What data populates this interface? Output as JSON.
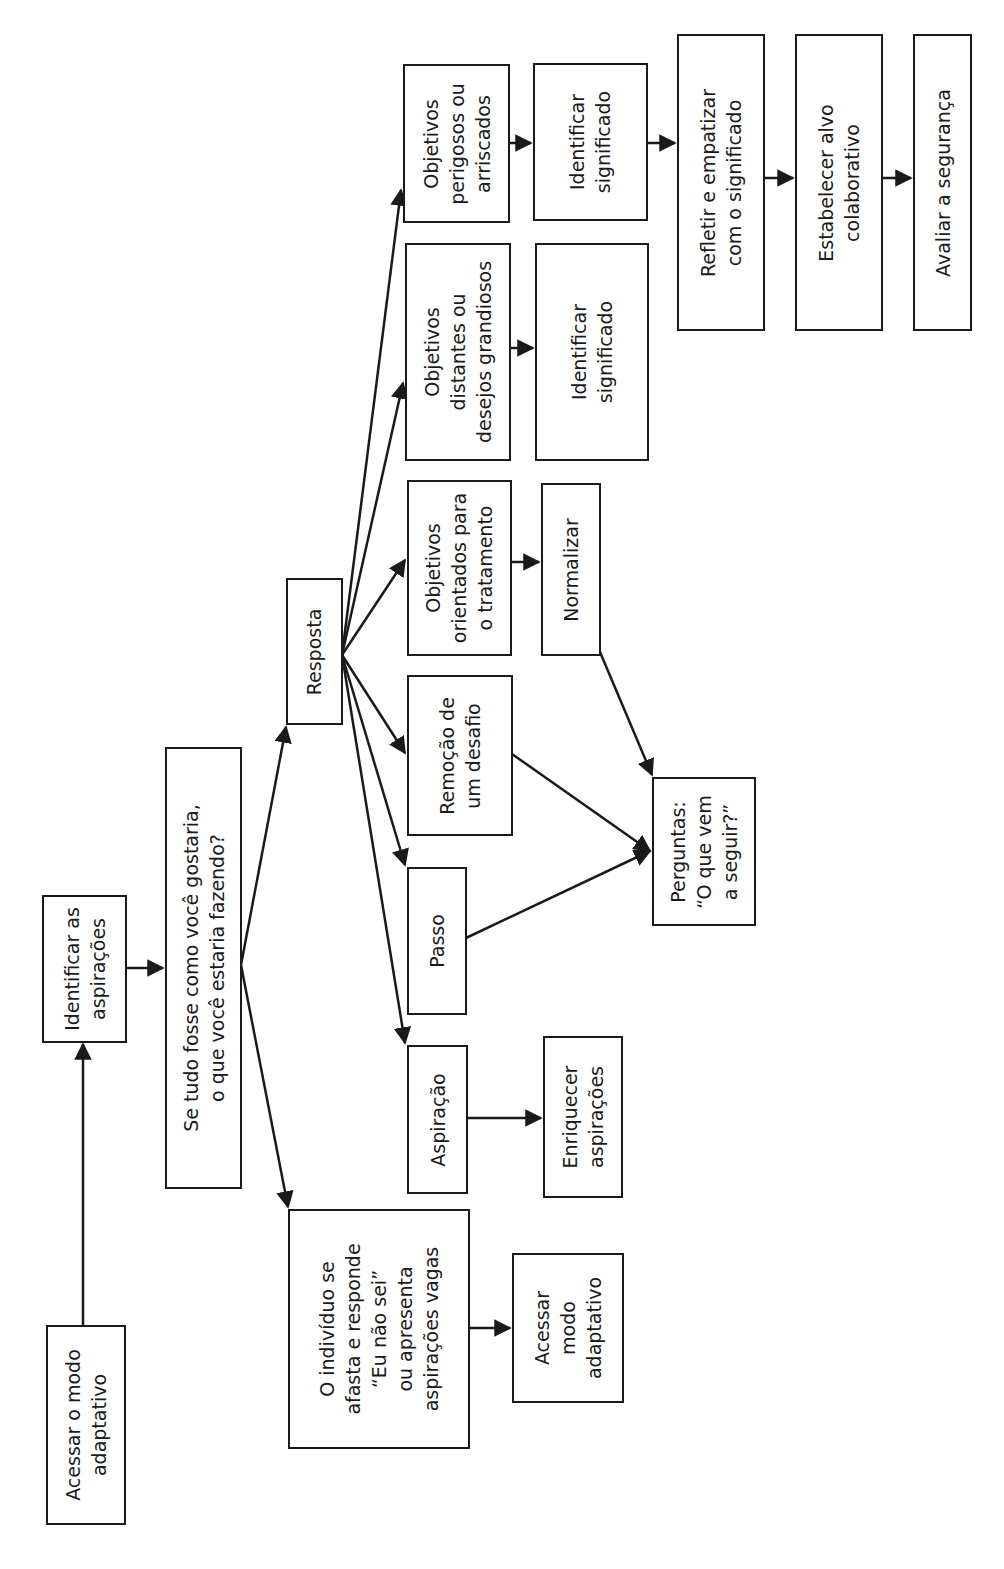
{
  "diagram": {
    "type": "flowchart",
    "orientation": "rotated-90-counterclockwise",
    "line_color": "#1a1a1a",
    "background": "#ffffff",
    "nodes": {
      "acessar_modo_adaptativo_root": "Acessar o modo\nadaptativo",
      "identificar_aspiracoes": "Identificar as\naspirações",
      "pergunta_se_tudo_fosse": "Se tudo fosse como você gostaria,\no que você estaria fazendo?",
      "individuo_se_afasta": "O indivíduo se\nafasta e responde\n“Eu não sei”\nou apresenta\naspirações vagas",
      "acessar_modo_adaptativo_leaf": "Acessar\nmodo\nadaptativo",
      "resposta": "Resposta",
      "aspiracao": "Aspiração",
      "enriquecer_aspiracoes": "Enriquecer\naspirações",
      "passo": "Passo",
      "remocao_desafio": "Remoção de\num desafio",
      "perguntas_o_que_vem": "Perguntas:\n“O que vem\na seguir?”",
      "objetivos_tratamento": "Objetivos\norientados para\no tratamento",
      "normalizar": "Normalizar",
      "objetivos_distantes": "Objetivos\ndistantes ou\ndesejos grandiosos",
      "identificar_significado_2": "Identificar\nsignificado",
      "objetivos_perigosos": "Objetivos\nperigosos ou\narriscados",
      "identificar_significado_1": "Identificar\nsignificado",
      "refletir_empatizar": "Refletir e empatizar\ncom o significado",
      "estabelecer_alvo": "Estabelecer alvo\ncolaborativo",
      "avaliar_seguranca": "Avaliar a segurança"
    },
    "edges": [
      [
        "acessar_modo_adaptativo_root",
        "identificar_aspiracoes"
      ],
      [
        "identificar_aspiracoes",
        "pergunta_se_tudo_fosse"
      ],
      [
        "pergunta_se_tudo_fosse",
        "resposta"
      ],
      [
        "pergunta_se_tudo_fosse",
        "individuo_se_afasta"
      ],
      [
        "individuo_se_afasta",
        "acessar_modo_adaptativo_leaf"
      ],
      [
        "resposta",
        "objetivos_perigosos"
      ],
      [
        "resposta",
        "objetivos_distantes"
      ],
      [
        "resposta",
        "objetivos_tratamento"
      ],
      [
        "resposta",
        "remocao_desafio"
      ],
      [
        "resposta",
        "passo"
      ],
      [
        "resposta",
        "aspiracao"
      ],
      [
        "aspiracao",
        "enriquecer_aspiracoes"
      ],
      [
        "passo",
        "perguntas_o_que_vem"
      ],
      [
        "remocao_desafio",
        "perguntas_o_que_vem"
      ],
      [
        "objetivos_tratamento",
        "normalizar"
      ],
      [
        "normalizar",
        "perguntas_o_que_vem"
      ],
      [
        "objetivos_distantes",
        "identificar_significado_2"
      ],
      [
        "objetivos_perigosos",
        "identificar_significado_1"
      ],
      [
        "identificar_significado_1",
        "refletir_empatizar"
      ],
      [
        "refletir_empatizar",
        "estabelecer_alvo"
      ],
      [
        "estabelecer_alvo",
        "avaliar_seguranca"
      ]
    ]
  }
}
